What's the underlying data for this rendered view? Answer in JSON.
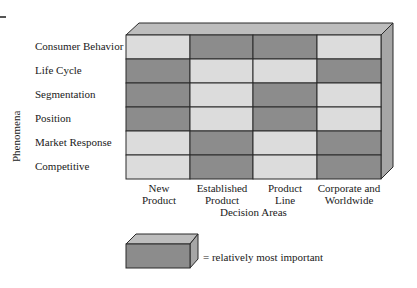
{
  "diagram": {
    "y_axis_title": "Phenomena",
    "x_axis_title": "Decision Areas",
    "rows": [
      "Consumer Behavior",
      "Life Cycle",
      "Segmentation",
      "Position",
      "Market Response",
      "Competitive"
    ],
    "columns": [
      {
        "line1": "New",
        "line2": "Product"
      },
      {
        "line1": "Established",
        "line2": "Product"
      },
      {
        "line1": "Product",
        "line2": "Line"
      },
      {
        "line1": "Corporate and",
        "line2": "Worldwide"
      }
    ],
    "importance_matrix": [
      [
        0,
        1,
        1,
        0
      ],
      [
        1,
        0,
        0,
        1
      ],
      [
        1,
        0,
        1,
        0
      ],
      [
        1,
        0,
        1,
        0
      ],
      [
        0,
        1,
        0,
        1
      ],
      [
        0,
        1,
        0,
        1
      ]
    ],
    "legend": {
      "text": "= relatively most important"
    },
    "colors": {
      "important": "#8c8c8c",
      "not_important": "#dcdcdc",
      "top_face": "#bdbdbd",
      "side_face": "#a6a6a6",
      "lines": "#2a2a2a"
    }
  }
}
